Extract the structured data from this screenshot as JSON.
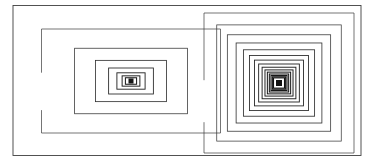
{
  "figure": {
    "title": "Nested rectangle spiral",
    "type": "vector-line-drawing",
    "width": 374,
    "height": 163,
    "background_color": "#ffffff",
    "stroke_color": "#3a3a3a",
    "stroke_color_dark": "#111111",
    "base_stroke_width": 0.7
  },
  "outer_frame": {
    "name": "outer-frame",
    "x": 13,
    "y": 5.5,
    "width": 348,
    "height": 150,
    "stroke": "#3f3f3f",
    "stroke_width": 0.9,
    "closed": true
  },
  "left_group": {
    "name": "left-nest",
    "label": "Left nested rectangle group",
    "center_x": 131,
    "center_y": 81,
    "outer_x": 27,
    "outer_y": 29,
    "outer_width": 179,
    "outer_height": 104,
    "ring_count": 9,
    "shrink_ratio": 0.63,
    "gap_ring_index": 0,
    "gap_fraction": 0.42,
    "core_size": 5,
    "core_color": "#151515"
  },
  "right_group": {
    "name": "right-nest",
    "label": "Right nested rectangle group",
    "center_x": 279,
    "center_y": 83,
    "outer_x": 204,
    "outer_y": 12,
    "outer_width": 150,
    "outer_height": 140,
    "ring_count": 15,
    "shrink_ratio": 0.83,
    "gap_ring_index": 0,
    "gap_fraction": 0.48,
    "core_size": 6,
    "core_color": "#121212"
  }
}
